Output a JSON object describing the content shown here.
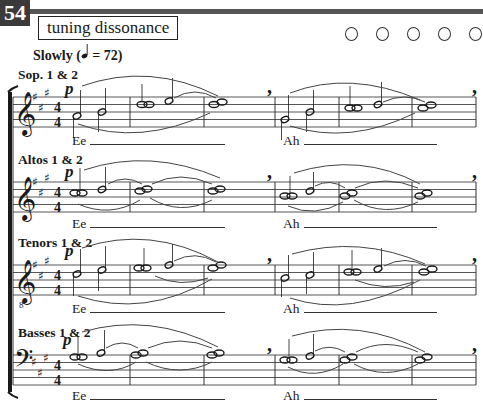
{
  "page": {
    "number": "54",
    "title": "tuning dissonance",
    "checkboxes": [
      {
        "state": "empty"
      },
      {
        "state": "empty"
      },
      {
        "state": "empty"
      },
      {
        "state": "empty"
      },
      {
        "state": "empty"
      }
    ]
  },
  "tempo": {
    "text_before": "Slowly (",
    "note_icon": "quarter-note-icon",
    "text_after": " = 72)"
  },
  "parts": [
    {
      "label": "Sop. 1 & 2",
      "clef": "treble",
      "key": "A major (3 sharps)",
      "time": "4/4",
      "dynamic": "p",
      "lyrics": [
        "Ee",
        "Ah"
      ]
    },
    {
      "label": "Altos 1 & 2",
      "clef": "treble",
      "key": "A major (3 sharps)",
      "time": "4/4",
      "dynamic": "p",
      "lyrics": [
        "Ee",
        "Ah"
      ]
    },
    {
      "label": "Tenors 1 & 2",
      "clef": "treble-8vb",
      "key": "A major (3 sharps)",
      "time": "4/4",
      "dynamic": "p",
      "lyrics": [
        "Ee",
        "Ah"
      ]
    },
    {
      "label": "Basses 1 & 2",
      "clef": "bass",
      "key": "A major (3 sharps)",
      "time": "4/4",
      "dynamic": "p",
      "lyrics": [
        "Ee",
        "Ah"
      ]
    }
  ],
  "symbols": {
    "dynamic": "p",
    "breath_mark": ",",
    "time_top": "4",
    "time_bottom": "4",
    "sharp": "♯",
    "octave_8": "8"
  }
}
